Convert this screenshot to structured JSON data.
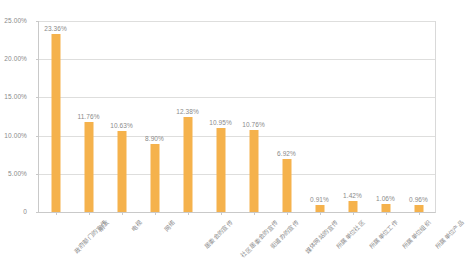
{
  "chart_data": {
    "type": "bar",
    "title": "",
    "subtitle": "",
    "xlabel": "",
    "ylabel": "",
    "ylim": [
      0,
      25
    ],
    "y_tick_labels": [
      "0",
      "5.00%",
      "10.00%",
      "15.00%",
      "20.00%",
      "25.00%"
    ],
    "y_tick_values": [
      0,
      5,
      10,
      15,
      20,
      25
    ],
    "grid": true,
    "legend": false,
    "legend_position": "none",
    "value_label_format": "percent_2dp",
    "categories": [
      "政府部门的宣传",
      "朋友",
      "电视",
      "网络",
      "居委会的宣传",
      "社区居委会的宣传",
      "街道办的宣传",
      "媒体网站的宣传",
      "所属单位社区",
      "所属单位工作",
      "所属单位组织",
      "所属单位产品"
    ],
    "value_labels": [
      "23.36%",
      "11.76%",
      "10.63%",
      "8.90%",
      "12.38%",
      "10.95%",
      "10.76%",
      "6.92%",
      "0.91%",
      "1.42%",
      "1.06%",
      "0.96%"
    ],
    "values": [
      23.36,
      11.76,
      10.63,
      8.9,
      12.38,
      10.95,
      10.76,
      6.92,
      0.91,
      1.42,
      1.06,
      0.96
    ],
    "colors": {
      "bar": "#f5b24c",
      "gridline": "#dededd",
      "axis": "#c9c9c9",
      "tick_text": "#8a8a8a",
      "background": "#ffffff"
    }
  }
}
